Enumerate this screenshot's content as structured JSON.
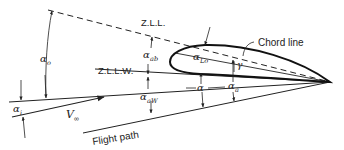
{
  "diagram": {
    "labels": {
      "zll": "Z.L.L.",
      "zllw": "Z.L.L.W.",
      "chord_line": "Chord line",
      "flight_path": "Flight path",
      "v_inf": "V",
      "v_inf_sub": "∞",
      "alpha_o": "α",
      "alpha_o_sub": "o",
      "alpha_ab": "α",
      "alpha_ab_sub": "ab",
      "alpha_lo": "α",
      "alpha_lo_sub": "Lo",
      "gamma": "γ",
      "alpha_aw": "α",
      "alpha_aw_sub": "aW",
      "alpha": "α",
      "alpha_a": "α",
      "alpha_a_sub": "a",
      "alpha_i": "α",
      "alpha_i_sub": "i"
    },
    "colors": {
      "line": "#222222",
      "background": "#ffffff"
    }
  }
}
